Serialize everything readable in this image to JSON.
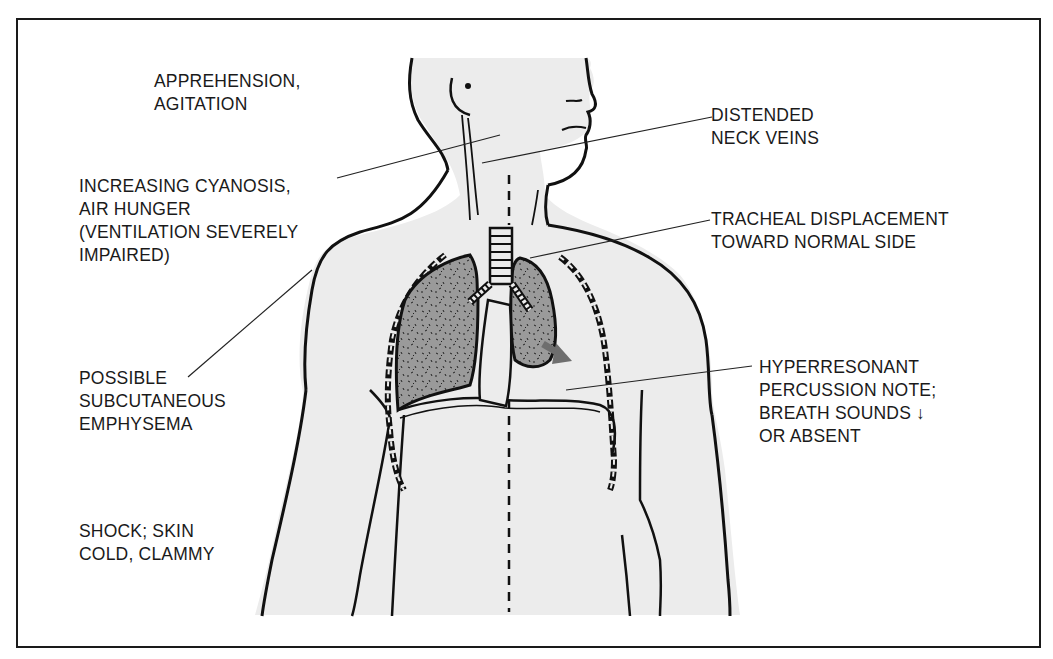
{
  "diagram": {
    "labels": {
      "apprehension": {
        "lines": [
          "APPREHENSION,",
          "AGITATION"
        ]
      },
      "cyanosis": {
        "lines": [
          "INCREASING CYANOSIS,",
          "AIR HUNGER",
          "(VENTILATION SEVERELY",
          "IMPAIRED)"
        ]
      },
      "subcutaneous": {
        "lines": [
          "POSSIBLE",
          "SUBCUTANEOUS",
          "EMPHYSEMA"
        ]
      },
      "shock": {
        "lines": [
          "SHOCK; SKIN",
          "COLD, CLAMMY"
        ]
      },
      "neck_veins": {
        "lines": [
          "DISTENDED",
          "NECK VEINS"
        ]
      },
      "tracheal": {
        "lines": [
          "TRACHEAL DISPLACEMENT",
          "TOWARD NORMAL SIDE"
        ]
      },
      "hyperresonant": {
        "lines": [
          "HYPERRESONANT",
          "PERCUSSION NOTE;",
          "BREATH SOUNDS ↓",
          "OR ABSENT"
        ]
      }
    },
    "colors": {
      "skin": "#ececec",
      "lung": "#9a9a9a",
      "outline": "#111111",
      "arrow": "#6e6e6e",
      "background": "#ffffff"
    }
  }
}
